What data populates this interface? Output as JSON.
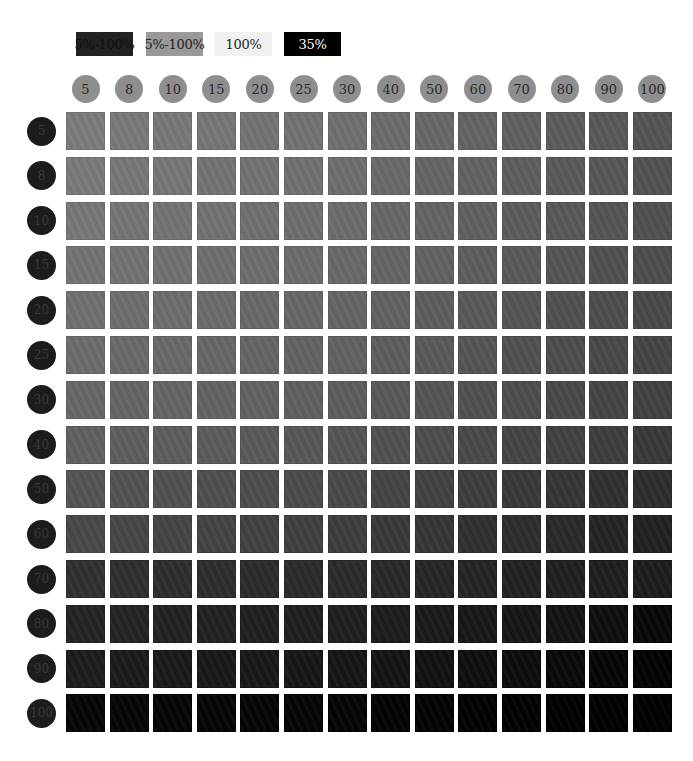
{
  "legend": [
    {
      "label": "5%-100%",
      "bg": "#222222",
      "fg": "#111111"
    },
    {
      "label": "5%-100%",
      "bg": "#999999",
      "fg": "#222222"
    },
    {
      "label": "100%",
      "bg": "#f0f0f0",
      "fg": "#222222"
    },
    {
      "label": "35%",
      "bg": "#000000",
      "fg": "#ffffff"
    }
  ],
  "chart_data": {
    "type": "heatmap",
    "title": "",
    "xlabel": "",
    "ylabel": "",
    "x_categories": [
      "5",
      "8",
      "10",
      "15",
      "20",
      "25",
      "30",
      "40",
      "50",
      "60",
      "70",
      "80",
      "90",
      "100"
    ],
    "y_categories": [
      "5",
      "8",
      "10",
      "15",
      "20",
      "25",
      "30",
      "40",
      "50",
      "60",
      "70",
      "80",
      "90",
      "100"
    ],
    "legend": [
      "5%-100%",
      "5%-100%",
      "100%",
      "35%"
    ],
    "value_description": "gray level (0-255) of each swatch; darker toward bottom-right",
    "values": [
      [
        123,
        121,
        120,
        118,
        116,
        114,
        112,
        108,
        104,
        100,
        96,
        92,
        88,
        84
      ],
      [
        121,
        119,
        118,
        116,
        114,
        112,
        110,
        106,
        102,
        98,
        94,
        90,
        86,
        82
      ],
      [
        119,
        117,
        116,
        114,
        112,
        110,
        108,
        104,
        100,
        96,
        92,
        88,
        84,
        80
      ],
      [
        116,
        114,
        113,
        111,
        109,
        107,
        105,
        101,
        97,
        93,
        89,
        85,
        81,
        77
      ],
      [
        112,
        110,
        109,
        107,
        105,
        103,
        101,
        97,
        93,
        89,
        85,
        81,
        77,
        73
      ],
      [
        108,
        106,
        105,
        103,
        101,
        99,
        97,
        93,
        89,
        85,
        81,
        77,
        73,
        69
      ],
      [
        104,
        102,
        101,
        99,
        97,
        95,
        93,
        89,
        85,
        81,
        77,
        73,
        69,
        65
      ],
      [
        96,
        94,
        93,
        91,
        89,
        87,
        85,
        81,
        77,
        73,
        69,
        65,
        61,
        57
      ],
      [
        84,
        82,
        81,
        79,
        77,
        75,
        73,
        69,
        65,
        61,
        57,
        53,
        49,
        45
      ],
      [
        72,
        70,
        69,
        67,
        65,
        63,
        61,
        57,
        53,
        49,
        45,
        41,
        37,
        33
      ],
      [
        48,
        47,
        46,
        45,
        44,
        43,
        42,
        40,
        38,
        36,
        34,
        32,
        30,
        28
      ],
      [
        36,
        35,
        34,
        33,
        32,
        31,
        30,
        28,
        26,
        24,
        22,
        20,
        14,
        8
      ],
      [
        28,
        27,
        26,
        25,
        24,
        23,
        22,
        20,
        18,
        15,
        12,
        9,
        6,
        3
      ],
      [
        6,
        6,
        5,
        5,
        5,
        4,
        4,
        3,
        3,
        2,
        2,
        1,
        1,
        0
      ]
    ],
    "grid": false
  }
}
